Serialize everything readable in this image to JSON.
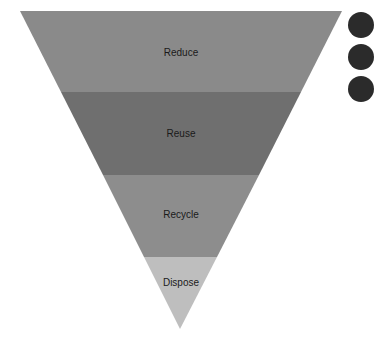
{
  "diagram": {
    "type": "inverted-pyramid",
    "layers": [
      {
        "label": "Reduce",
        "color": "#8a8a8a"
      },
      {
        "label": "Reuse",
        "color": "#6f6f6f"
      },
      {
        "label": "Recycle",
        "color": "#8d8d8d"
      },
      {
        "label": "Dispose",
        "color": "#bebebe"
      }
    ],
    "side_markers": [
      {
        "color": "#2b2b2b"
      },
      {
        "color": "#2b2b2b"
      },
      {
        "color": "#2b2b2b"
      }
    ]
  }
}
